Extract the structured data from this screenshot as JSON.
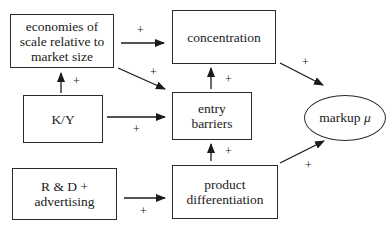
{
  "diagram": {
    "nodes": {
      "economies": {
        "line1": "economies of",
        "line2": "scale relative to",
        "line3": "market size"
      },
      "concentration": {
        "label": "concentration"
      },
      "ky": {
        "label": "K/Y"
      },
      "entry_barriers": {
        "line1": "entry",
        "line2": "barriers"
      },
      "markup": {
        "label": "markup",
        "symbol": "μ"
      },
      "rd": {
        "line1": "R & D +",
        "line2": "advertising"
      },
      "product_diff": {
        "line1": "product",
        "line2": "differentiation"
      }
    },
    "edges": [
      {
        "from": "economies",
        "to": "concentration",
        "sign": "+"
      },
      {
        "from": "economies",
        "to": "entry_barriers",
        "sign": "+"
      },
      {
        "from": "ky",
        "to": "economies",
        "sign": "+"
      },
      {
        "from": "ky",
        "to": "entry_barriers",
        "sign": "+"
      },
      {
        "from": "entry_barriers",
        "to": "concentration",
        "sign": "+"
      },
      {
        "from": "concentration",
        "to": "markup",
        "sign": "+"
      },
      {
        "from": "product_diff",
        "to": "entry_barriers",
        "sign": "+"
      },
      {
        "from": "product_diff",
        "to": "markup",
        "sign": "+"
      },
      {
        "from": "rd",
        "to": "product_diff",
        "sign": "+"
      }
    ]
  }
}
